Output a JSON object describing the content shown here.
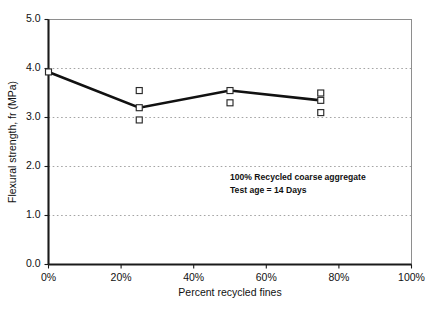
{
  "chart_data": {
    "type": "line",
    "title": "",
    "xlabel": "Percent recycled fines",
    "ylabel": "Flexural strength, fr (MPa)",
    "xlim": [
      0,
      100
    ],
    "ylim": [
      0,
      5
    ],
    "x_tick_labels": [
      "0%",
      "20%",
      "40%",
      "60%",
      "80%",
      "100%"
    ],
    "x_tick_values": [
      0,
      20,
      40,
      60,
      80,
      100
    ],
    "y_tick_labels": [
      "0.0",
      "1.0",
      "2.0",
      "3.0",
      "4.0",
      "5.0"
    ],
    "y_tick_values": [
      0,
      1,
      2,
      3,
      4,
      5
    ],
    "grid": "horizontal-dotted",
    "gridlines_y": [
      1,
      2,
      3,
      4
    ],
    "legend": "none",
    "series": [
      {
        "name": "Mean flexural strength",
        "style": "line",
        "x": [
          0,
          25,
          50,
          75
        ],
        "values": [
          3.93,
          3.2,
          3.55,
          3.35
        ]
      },
      {
        "name": "Individual specimen results",
        "style": "open-square-markers",
        "points": [
          {
            "x": 0,
            "y": 3.93
          },
          {
            "x": 25,
            "y": 3.55
          },
          {
            "x": 25,
            "y": 3.2
          },
          {
            "x": 25,
            "y": 2.95
          },
          {
            "x": 50,
            "y": 3.55
          },
          {
            "x": 50,
            "y": 3.3
          },
          {
            "x": 75,
            "y": 3.5
          },
          {
            "x": 75,
            "y": 3.35
          },
          {
            "x": 75,
            "y": 3.1
          }
        ]
      }
    ],
    "annotations": [
      {
        "text": "100% Recycled coarse aggregate",
        "x": 50,
        "y": 1.72
      },
      {
        "text": "Test age = 14 Days",
        "x": 50,
        "y": 1.46
      }
    ]
  },
  "colors": {
    "line": "#111111",
    "marker_stroke": "#2a2a2a",
    "marker_fill": "#ffffff",
    "grid": "#9a9a9a",
    "axis": "#1a1a1a",
    "frame": "#8e8e8e",
    "background": "#ffffff"
  }
}
